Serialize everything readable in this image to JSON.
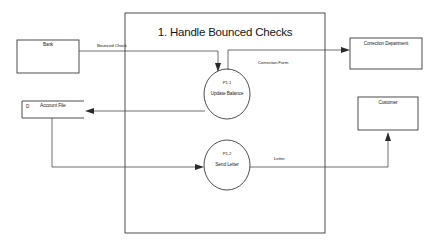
{
  "diagram": {
    "title": "1. Handle Bounced Checks",
    "type": "data-flow-diagram",
    "boundary": {
      "x": 125,
      "y": 13,
      "width": 200,
      "height": 220
    }
  },
  "external_entities": [
    {
      "name": "Bank",
      "x": 17,
      "y": 40,
      "width": 62,
      "height": 33
    },
    {
      "name": "Correction Department",
      "x": 350,
      "y": 38,
      "width": 72,
      "height": 31
    },
    {
      "name": "Customer",
      "x": 358,
      "y": 97,
      "width": 60,
      "height": 33
    }
  ],
  "processes": [
    {
      "id": "P1.1",
      "name": "Update Balance",
      "cx": 227,
      "cy": 94,
      "rx": 23,
      "ry": 25
    },
    {
      "id": "P1.2",
      "name": "Send Letter",
      "cx": 227,
      "cy": 165,
      "rx": 23,
      "ry": 25
    }
  ],
  "data_stores": [
    {
      "id": "D",
      "name": "Account File",
      "x": 22,
      "y": 101,
      "width": 62,
      "height": 17
    }
  ],
  "flows": [
    {
      "label": "Bounced Check",
      "from": "Bank",
      "to": "P1.1"
    },
    {
      "label": "Correction Form",
      "from": "P1.1",
      "to": "Correction Department"
    },
    {
      "label": "",
      "from": "P1.1",
      "to": "Account File"
    },
    {
      "label": "",
      "from": "Account File",
      "to": "P1.2"
    },
    {
      "label": "Letter",
      "from": "P1.2",
      "to": "Customer"
    }
  ],
  "colors": {
    "stroke": "#3a3a3a",
    "flow": "#4a4a4a",
    "text": "#1c1c1c",
    "background": "#ffffff"
  }
}
